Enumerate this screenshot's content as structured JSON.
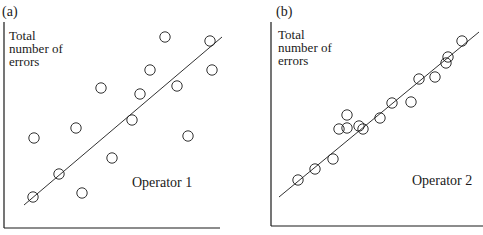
{
  "chart_data": [
    {
      "type": "scatter",
      "panel_label": "(a)",
      "ylabel": [
        "Total",
        "number of",
        "errors"
      ],
      "xlabel": "",
      "annotation": "Operator 1",
      "grid": false,
      "legend": null,
      "trend_line": true,
      "axis_px": {
        "x0": 4,
        "y0": 228,
        "x1": 220,
        "ytop": 22
      },
      "line_px": [
        [
          24,
          205
        ],
        [
          222,
          37
        ]
      ],
      "points_px": [
        [
          33,
          197
        ],
        [
          59,
          174
        ],
        [
          82,
          193
        ],
        [
          34,
          138
        ],
        [
          76,
          128
        ],
        [
          101,
          88
        ],
        [
          112,
          158
        ],
        [
          132,
          120
        ],
        [
          140,
          94
        ],
        [
          150,
          70
        ],
        [
          165,
          37
        ],
        [
          177,
          86
        ],
        [
          188,
          136
        ],
        [
          210,
          41
        ],
        [
          212,
          70
        ]
      ]
    },
    {
      "type": "scatter",
      "panel_label": "(b)",
      "ylabel": [
        "Total",
        "number of",
        "errors"
      ],
      "xlabel": "",
      "annotation": "Operator 2",
      "grid": false,
      "legend": null,
      "trend_line": true,
      "axis_px": {
        "x0": 271,
        "y0": 226,
        "x1": 483,
        "ytop": 22
      },
      "line_px": [
        [
          279,
          197
        ],
        [
          479,
          32
        ]
      ],
      "points_px": [
        [
          298,
          180
        ],
        [
          315,
          169
        ],
        [
          333,
          159
        ],
        [
          339,
          129
        ],
        [
          347,
          128
        ],
        [
          347,
          115
        ],
        [
          359,
          126
        ],
        [
          363,
          129
        ],
        [
          380,
          118
        ],
        [
          392,
          103
        ],
        [
          411,
          102
        ],
        [
          419,
          79
        ],
        [
          435,
          77
        ],
        [
          446,
          63
        ],
        [
          448,
          57
        ],
        [
          462,
          41
        ]
      ]
    }
  ],
  "colors": {
    "ink": "#1a1a1a",
    "background": "#ffffff"
  }
}
